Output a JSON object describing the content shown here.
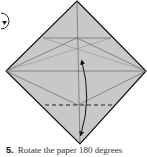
{
  "diagram": {
    "paper_fill": "#c8c8c8",
    "line_color": "#111111",
    "crease_color": "#555555",
    "symbols": [
      "rotate-symbol",
      "valley-fold-dashed-line",
      "fold-and-unfold-arrow"
    ]
  },
  "caption": {
    "step_number": "5.",
    "text": "Rotate the paper 180 degrees"
  }
}
